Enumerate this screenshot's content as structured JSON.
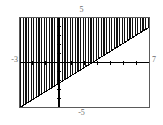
{
  "widget": {
    "name": "inequality-graph",
    "background": "#ffffff",
    "frame_color": "#5a5a5a",
    "axis_color": "#000000",
    "hatch_color": "#111111",
    "label_color": "#6b6b6b"
  },
  "labels": {
    "y_max": "5",
    "y_min": "-5",
    "x_min": "-3",
    "x_max": "7"
  },
  "chart_data": {
    "type": "area",
    "title": "",
    "xlabel": "",
    "ylabel": "",
    "xlim": [
      -3,
      7
    ],
    "ylim": [
      -5,
      5
    ],
    "grid": false,
    "legend": false,
    "x_tick_labels": [
      "-3",
      "7"
    ],
    "y_tick_labels": [
      "-5",
      "5"
    ],
    "x_ticks": [
      -2,
      -1,
      1,
      2,
      3,
      4,
      5,
      6
    ],
    "y_ticks": [
      -4,
      -3,
      -2,
      -1,
      1,
      2,
      3,
      4
    ],
    "axes": {
      "x_axis_at_y": 0,
      "y_axis_at_x": 0
    },
    "shading": {
      "style": "vertical-hatch",
      "line_spacing_px": 2.6,
      "line_width_px": 1.3,
      "description": "region above the boundary line, hatched with dense vertical strokes"
    },
    "series": [
      {
        "name": "boundary-line",
        "type": "line",
        "style": "solid",
        "slope": 0.9,
        "intercept": -2.35,
        "x": [
          -3,
          7
        ],
        "values": [
          -5.05,
          3.95
        ],
        "shade_side": "above"
      }
    ],
    "annotations": []
  }
}
